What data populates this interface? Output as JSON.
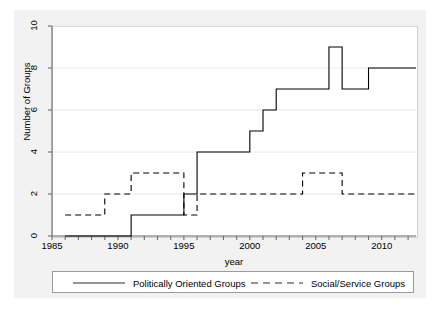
{
  "chart_data": {
    "type": "line",
    "subtype": "step",
    "title": "",
    "xlabel": "year",
    "ylabel": "Number of Groups",
    "xlim": [
      1985,
      2012.6
    ],
    "ylim": [
      0,
      10
    ],
    "yticks": [
      0,
      2,
      4,
      6,
      8,
      10
    ],
    "xticks": [
      1985,
      1990,
      1995,
      2000,
      2005,
      2010
    ],
    "xminor_ticks": [
      1986,
      1987,
      1988,
      1989,
      1991,
      1992,
      1993,
      1994,
      1996,
      1997,
      1998,
      1999,
      2001,
      2002,
      2003,
      2004,
      2006,
      2007,
      2008,
      2009,
      2011,
      2012
    ],
    "grid": "horizontal",
    "legend_position": "bottom",
    "x": [
      1986,
      1987,
      1988,
      1989,
      1990,
      1991,
      1992,
      1993,
      1994,
      1995,
      1996,
      1997,
      1998,
      1999,
      2000,
      2001,
      2002,
      2003,
      2004,
      2005,
      2006,
      2007,
      2008,
      2009,
      2010,
      2011,
      2012
    ],
    "series": [
      {
        "name": "Politically Oriented Groups",
        "style": "solid",
        "color": "#000000",
        "values": [
          0,
          0,
          0,
          0,
          0,
          1,
          1,
          1,
          1,
          2,
          4,
          4,
          4,
          4,
          5,
          6,
          7,
          7,
          7,
          7,
          9,
          7,
          7,
          8,
          8,
          8,
          8
        ]
      },
      {
        "name": "Social/Service Groups",
        "style": "dashed",
        "color": "#000000",
        "values": [
          1,
          1,
          1,
          2,
          2,
          3,
          3,
          3,
          3,
          1,
          2,
          2,
          2,
          2,
          2,
          2,
          2,
          2,
          3,
          3,
          3,
          2,
          2,
          2,
          2,
          2,
          2
        ]
      }
    ]
  },
  "axes": {
    "ylabel": "Number of Groups",
    "xlabel": "year",
    "ytick_labels": [
      "0",
      "2",
      "4",
      "6",
      "8",
      "10"
    ],
    "xtick_labels": [
      "1985",
      "1990",
      "1995",
      "2000",
      "2005",
      "2010"
    ]
  },
  "legend": {
    "entries": [
      {
        "label": "Politically Oriented Groups",
        "style": "solid"
      },
      {
        "label": "Social/Service Groups",
        "style": "dashed"
      }
    ]
  },
  "colors": {
    "figure_background": "#f2f2f2",
    "plot_background": "#ffffff",
    "grid": "#e8e8e8",
    "axis": "#6e6e6e",
    "line": "#2b2b2b"
  }
}
